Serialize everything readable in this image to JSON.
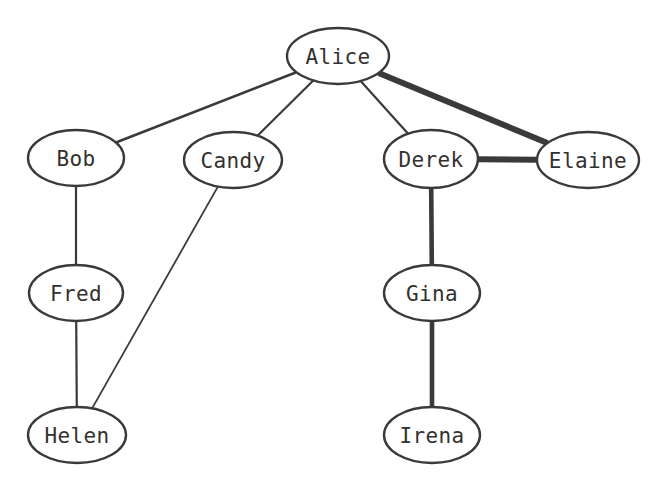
{
  "diagram": {
    "type": "node-link-graph",
    "background_color": "#ffffff",
    "node_fill_color": "#ffffff",
    "node_stroke_color": "#3a3a3a",
    "edge_color": "#3a3a3a",
    "label_color": "#33312f",
    "nodes": [
      {
        "id": "alice",
        "label": "Alice",
        "cx": 338,
        "cy": 56,
        "rx": 51,
        "ry": 28
      },
      {
        "id": "bob",
        "label": "Bob",
        "cx": 76,
        "cy": 158,
        "rx": 48,
        "ry": 28
      },
      {
        "id": "candy",
        "label": "Candy",
        "cx": 233,
        "cy": 160,
        "rx": 49,
        "ry": 28
      },
      {
        "id": "derek",
        "label": "Derek",
        "cx": 431,
        "cy": 159,
        "rx": 47,
        "ry": 29
      },
      {
        "id": "elaine",
        "label": "Elaine",
        "cx": 588,
        "cy": 160,
        "rx": 51,
        "ry": 28
      },
      {
        "id": "fred",
        "label": "Fred",
        "cx": 76,
        "cy": 293,
        "rx": 47,
        "ry": 28
      },
      {
        "id": "gina",
        "label": "Gina",
        "cx": 432,
        "cy": 293,
        "rx": 48,
        "ry": 28
      },
      {
        "id": "helen",
        "label": "Helen",
        "cx": 77,
        "cy": 435,
        "rx": 49,
        "ry": 28
      },
      {
        "id": "irena",
        "label": "Irena",
        "cx": 432,
        "cy": 435,
        "rx": 48,
        "ry": 28
      }
    ],
    "edges": [
      {
        "id": "alice-bob",
        "source": "alice",
        "target": "bob",
        "weight": 2.6
      },
      {
        "id": "alice-candy",
        "source": "alice",
        "target": "candy",
        "weight": 2.2
      },
      {
        "id": "alice-derek",
        "source": "alice",
        "target": "derek",
        "weight": 2.2
      },
      {
        "id": "alice-elaine",
        "source": "alice",
        "target": "elaine",
        "weight": 6.0
      },
      {
        "id": "derek-elaine",
        "source": "derek",
        "target": "elaine",
        "weight": 6.0
      },
      {
        "id": "bob-fred",
        "source": "bob",
        "target": "fred",
        "weight": 2.2
      },
      {
        "id": "fred-helen",
        "source": "fred",
        "target": "helen",
        "weight": 2.2
      },
      {
        "id": "candy-helen",
        "source": "candy",
        "target": "helen",
        "weight": 1.8
      },
      {
        "id": "derek-gina",
        "source": "derek",
        "target": "gina",
        "weight": 4.6
      },
      {
        "id": "gina-irena",
        "source": "gina",
        "target": "irena",
        "weight": 4.6
      }
    ]
  }
}
